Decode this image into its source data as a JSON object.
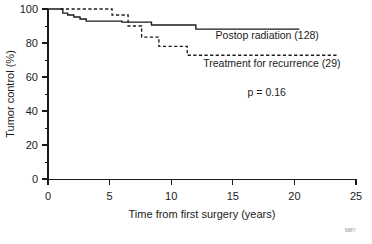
{
  "chart_data": {
    "type": "line",
    "title": "",
    "subtitle": "",
    "xlabel": "Time from first surgery (years)",
    "ylabel": "Tumor control (%)",
    "xlim": [
      0,
      25
    ],
    "ylim": [
      0,
      100
    ],
    "xticks": [
      0,
      5,
      10,
      15,
      20,
      25
    ],
    "xtick_labels": [
      "0",
      "5",
      "10",
      "15",
      "20",
      "25"
    ],
    "xminor_ticks": [
      2.5,
      7.5,
      12.5,
      17.5,
      22.5
    ],
    "yticks": [
      0,
      20,
      40,
      60,
      80,
      100
    ],
    "ytick_labels": [
      "0",
      "20",
      "40",
      "60",
      "80",
      "100"
    ],
    "yminor_ticks": [
      10,
      30,
      50,
      70,
      90
    ],
    "grid": false,
    "legend_position": "inline-right-of-curves",
    "step_type": "post",
    "annotations": [
      {
        "name": "p-value",
        "text": "p = 0.16",
        "x": 16.2,
        "y": 49
      },
      {
        "name": "corner-watermark",
        "text": "988Y",
        "x": 25.2,
        "y": -13
      }
    ],
    "series": [
      {
        "name": "Postop radiation (128)",
        "label": "Postop radiation (128)",
        "style": "solid",
        "color": "#1a1a1a",
        "n": 128,
        "label_x": 13.6,
        "label_y": 82.5,
        "points": [
          {
            "x": 0.0,
            "y": 100.0
          },
          {
            "x": 1.0,
            "y": 100.0
          },
          {
            "x": 1.2,
            "y": 97.6
          },
          {
            "x": 1.6,
            "y": 96.5
          },
          {
            "x": 2.1,
            "y": 95.3
          },
          {
            "x": 2.6,
            "y": 94.1
          },
          {
            "x": 3.1,
            "y": 92.9
          },
          {
            "x": 5.6,
            "y": 92.9
          },
          {
            "x": 6.0,
            "y": 92.3
          },
          {
            "x": 8.2,
            "y": 92.3
          },
          {
            "x": 8.4,
            "y": 90.6
          },
          {
            "x": 11.8,
            "y": 90.6
          },
          {
            "x": 12.0,
            "y": 88.2
          },
          {
            "x": 20.4,
            "y": 88.2
          }
        ]
      },
      {
        "name": "Treatment for recurrence (29)",
        "label": "Treatment for recurrence (29)",
        "style": "dashed",
        "color": "#1a1a1a",
        "n": 29,
        "label_x": 12.6,
        "label_y": 66.0,
        "points": [
          {
            "x": 1.0,
            "y": 100.0
          },
          {
            "x": 5.0,
            "y": 100.0
          },
          {
            "x": 5.2,
            "y": 96.5
          },
          {
            "x": 6.4,
            "y": 96.5
          },
          {
            "x": 6.5,
            "y": 90.0
          },
          {
            "x": 7.4,
            "y": 90.0
          },
          {
            "x": 7.6,
            "y": 83.5
          },
          {
            "x": 8.8,
            "y": 83.5
          },
          {
            "x": 9.0,
            "y": 78.0
          },
          {
            "x": 11.1,
            "y": 78.0
          },
          {
            "x": 11.3,
            "y": 72.8
          },
          {
            "x": 23.5,
            "y": 72.8
          }
        ]
      }
    ]
  }
}
